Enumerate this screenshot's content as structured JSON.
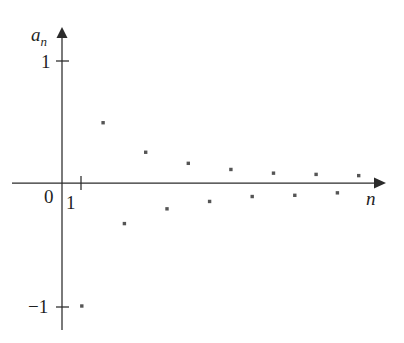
{
  "chart_data": {
    "type": "scatter",
    "title": "",
    "subtitle": "",
    "xlabel": "n",
    "ylabel": "a_n",
    "xlim": [
      0,
      15.2
    ],
    "ylim": [
      -1.35,
      1.25
    ],
    "grid": false,
    "legend": null,
    "x_ticks": [
      {
        "value": 1,
        "label": "1"
      }
    ],
    "y_ticks": [
      {
        "value": 1,
        "label": "1"
      },
      {
        "value": -1,
        "label": "−1"
      }
    ],
    "origin_label": "0",
    "series": [
      {
        "name": "a_n",
        "marker": "square-dot",
        "color": "#555555",
        "points": [
          {
            "n": 1,
            "a": -1.0
          },
          {
            "n": 2,
            "a": 0.49
          },
          {
            "n": 3,
            "a": -0.33
          },
          {
            "n": 4,
            "a": 0.25
          },
          {
            "n": 5,
            "a": -0.21
          },
          {
            "n": 6,
            "a": 0.16
          },
          {
            "n": 7,
            "a": -0.15
          },
          {
            "n": 8,
            "a": 0.11
          },
          {
            "n": 9,
            "a": -0.11
          },
          {
            "n": 10,
            "a": 0.08
          },
          {
            "n": 11,
            "a": -0.1
          },
          {
            "n": 12,
            "a": 0.07
          },
          {
            "n": 13,
            "a": -0.08
          },
          {
            "n": 14,
            "a": 0.06
          }
        ]
      }
    ],
    "axis_color": "#2b2b2b",
    "background_color": "#ffffff"
  },
  "labels": {
    "y_axis_name": "a",
    "y_axis_subscript": "n",
    "y_tick_top": "1",
    "y_tick_bottom": "−1",
    "origin": "0",
    "x_tick_first": "1",
    "x_axis_name": "n"
  }
}
